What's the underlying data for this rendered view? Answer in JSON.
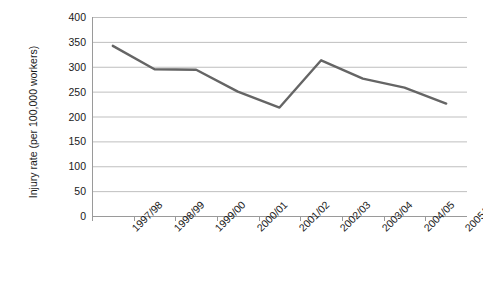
{
  "chart_data": {
    "type": "line",
    "title": "",
    "xlabel": "",
    "ylabel": "Injury rate (per 100,000 workers)",
    "categories": [
      "1997/98",
      "1998/99",
      "1999/00",
      "2000/01",
      "2001/02",
      "2002/03",
      "2003/04",
      "2004/05",
      "2005/06p"
    ],
    "values": [
      342,
      295,
      294,
      250,
      218,
      313,
      276,
      258,
      226
    ],
    "series": [
      {
        "name": "Injury rate",
        "values": [
          342,
          295,
          294,
          250,
          218,
          313,
          276,
          258,
          226
        ],
        "color": "#656565"
      }
    ],
    "ylim": [
      0,
      400
    ],
    "yticks": [
      0,
      50,
      100,
      150,
      200,
      250,
      300,
      350,
      400
    ],
    "ytick_labels": [
      "0",
      "50",
      "100",
      "150",
      "200",
      "250",
      "300",
      "350",
      "400"
    ],
    "grid": true,
    "grid_axis": "y",
    "legend": false,
    "legend_position": "none",
    "axis_color": "#9a9a9a",
    "grid_color": "#bfbfbf",
    "text_color": "#1a1a1a",
    "background": "#ffffff"
  }
}
